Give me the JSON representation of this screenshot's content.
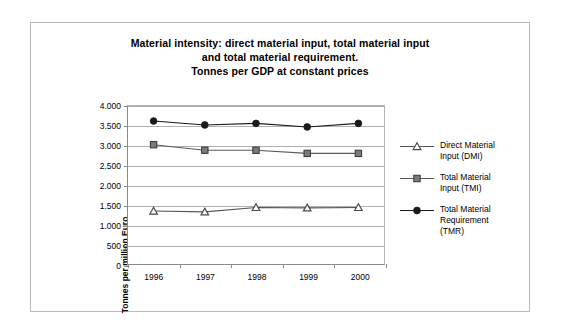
{
  "chart_data": {
    "type": "line",
    "title": "Material intensity: direct material input, total material input and total material requirement. Tonnes per GDP at constant prices",
    "title_lines": [
      "Material intensity: direct material input, total material input",
      "and total material requirement.",
      "Tonnes per GDP at constant prices"
    ],
    "xlabel": "",
    "ylabel": "Tonnes per million Euro",
    "categories": [
      "1996",
      "1997",
      "1998",
      "1999",
      "2000"
    ],
    "ylim": [
      0,
      4000
    ],
    "ytick_values": [
      0,
      500,
      1000,
      1500,
      2000,
      2500,
      3000,
      3500,
      4000
    ],
    "ytick_labels": [
      "0",
      "500",
      "1.000",
      "1.500",
      "2.000",
      "2.500",
      "3.000",
      "3.500",
      "4.000"
    ],
    "grid": true,
    "legend_position": "right",
    "series": [
      {
        "name": "Direct Material Input (DMI)",
        "name_lines": [
          "Direct Material",
          "Input (DMI)"
        ],
        "marker": "triangle",
        "color": "#555555",
        "values": [
          1340,
          1320,
          1430,
          1420,
          1430
        ]
      },
      {
        "name": "Total Material Input (TMI)",
        "name_lines": [
          "Total Material",
          "Input (TMI)"
        ],
        "marker": "square",
        "color": "#595959",
        "values": [
          3020,
          2880,
          2880,
          2800,
          2800
        ]
      },
      {
        "name": "Total Material Requirement (TMR)",
        "name_lines": [
          "Total Material",
          "Requirement",
          "(TMR)"
        ],
        "marker": "circle",
        "color": "#1a1a1a",
        "values": [
          3620,
          3520,
          3560,
          3470,
          3560
        ]
      }
    ]
  }
}
